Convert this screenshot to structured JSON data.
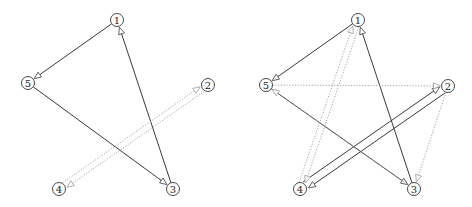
{
  "graphs": [
    {
      "name": "left-graph",
      "nodes": [
        {
          "id": "1",
          "label": "1",
          "x": 117,
          "y": 20
        },
        {
          "id": "2",
          "label": "2",
          "x": 208,
          "y": 85
        },
        {
          "id": "3",
          "label": "3",
          "x": 173,
          "y": 189
        },
        {
          "id": "4",
          "label": "4",
          "x": 59,
          "y": 189
        },
        {
          "id": "5",
          "label": "5",
          "x": 28,
          "y": 83
        }
      ],
      "edges": [
        {
          "from": "1",
          "to": "5",
          "style": "solid"
        },
        {
          "from": "5",
          "to": "3",
          "style": "solid"
        },
        {
          "from": "3",
          "to": "1",
          "style": "solid"
        },
        {
          "from": "4",
          "to": "2",
          "style": "dotted",
          "offset": -3
        },
        {
          "from": "2",
          "to": "4",
          "style": "dotted",
          "offset": -3
        }
      ]
    },
    {
      "name": "right-graph",
      "nodes": [
        {
          "id": "1",
          "label": "1",
          "x": 358,
          "y": 20
        },
        {
          "id": "2",
          "label": "2",
          "x": 448,
          "y": 86
        },
        {
          "id": "3",
          "label": "3",
          "x": 414,
          "y": 189
        },
        {
          "id": "4",
          "label": "4",
          "x": 300,
          "y": 189
        },
        {
          "id": "5",
          "label": "5",
          "x": 266,
          "y": 85
        }
      ],
      "edges": [
        {
          "from": "1",
          "to": "5",
          "style": "solid"
        },
        {
          "from": "5",
          "to": "3",
          "style": "solid"
        },
        {
          "from": "3",
          "to": "1",
          "style": "solid"
        },
        {
          "from": "2",
          "to": "4",
          "style": "solid",
          "offset": -4
        },
        {
          "from": "4",
          "to": "2",
          "style": "solid",
          "offset": -4
        },
        {
          "from": "5",
          "to": "2",
          "style": "dotted"
        },
        {
          "from": "3",
          "to": "5",
          "style": "dotted"
        },
        {
          "from": "2",
          "to": "3",
          "style": "dotted"
        },
        {
          "from": "1",
          "to": "4",
          "style": "dotted",
          "offset": -3
        },
        {
          "from": "4",
          "to": "1",
          "style": "dotted",
          "offset": -3
        }
      ]
    }
  ]
}
